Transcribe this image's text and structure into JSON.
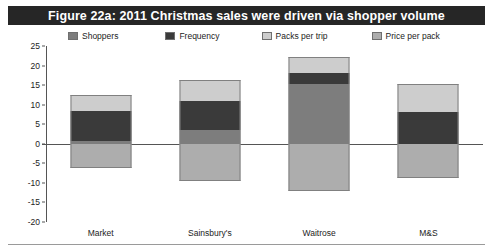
{
  "figure": {
    "title": "Figure 22a: 2011 Christmas sales were driven via shopper volume",
    "title_bar_color": "#262626",
    "title_text_color": "#ffffff"
  },
  "legend": {
    "position": "top",
    "items": [
      {
        "label": "Shoppers",
        "color": "#7d7d7d"
      },
      {
        "label": "Frequency",
        "color": "#3a3a3a"
      },
      {
        "label": "Packs per trip",
        "color": "#cdcdcd"
      },
      {
        "label": "Price per pack",
        "color": "#adadad"
      }
    ]
  },
  "axis": {
    "yticks": [
      25,
      20,
      15,
      10,
      5,
      0,
      -5,
      -10,
      -15,
      -20
    ],
    "ytick_labels": [
      "25",
      "20",
      "15",
      "10",
      "5",
      "0",
      "-5",
      "-10",
      "-15",
      "-20"
    ],
    "ymin": -20,
    "ymax": 25
  },
  "chart_data": {
    "type": "bar",
    "subtype": "stacked-bar-with-negatives",
    "title": "Figure 22a: 2011 Christmas sales were driven via shopper volume",
    "xlabel": "",
    "ylabel": "",
    "ylim": [
      -20,
      25
    ],
    "grid": false,
    "legend_position": "top",
    "categories": [
      "Market",
      "Sainsbury's",
      "Waitrose",
      "M&S"
    ],
    "series": [
      {
        "name": "Shoppers",
        "color": "#7d7d7d",
        "values": [
          0.7,
          3.5,
          15.2,
          0.0
        ]
      },
      {
        "name": "Frequency",
        "color": "#3a3a3a",
        "values": [
          7.8,
          7.5,
          3.0,
          8.2
        ]
      },
      {
        "name": "Packs per trip",
        "color": "#cdcdcd",
        "values": [
          4.0,
          5.2,
          3.9,
          7.0
        ]
      },
      {
        "name": "Price per pack",
        "color": "#adadad",
        "values": [
          -6.2,
          -9.5,
          -12.2,
          -8.8
        ]
      }
    ],
    "positive_totals": [
      12.5,
      16.2,
      22.1,
      15.2
    ],
    "negative_totals": [
      -6.2,
      -9.5,
      -12.2,
      -8.8
    ]
  }
}
